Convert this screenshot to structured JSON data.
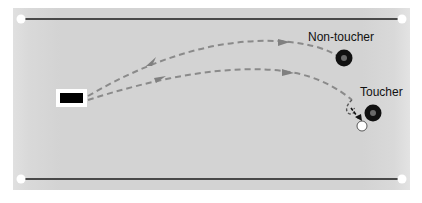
{
  "diagram": {
    "labels": {
      "non_toucher": "Non-toucher",
      "toucher": "Toucher"
    },
    "colors": {
      "panel": "#d5d5d5",
      "panel_edge": "#e2e2e2",
      "rail": "#1a1a1a",
      "corner_dot": "#ffffff",
      "path_dash": "#8a8a8a",
      "target_outer": "#111111",
      "target_center": "#6a6a6a",
      "ball": "#ffffff",
      "start_block": "#000000",
      "start_block_border": "#ffffff"
    },
    "elements": {
      "start_block": "black rectangle with white border (start position)",
      "non_toucher_target": "black ring target",
      "toucher_target": "black ring target",
      "ball": "white circle",
      "paths": [
        "upper dashed trajectory with arrow",
        "lower dashed trajectory with arrow curling to ball"
      ]
    }
  }
}
